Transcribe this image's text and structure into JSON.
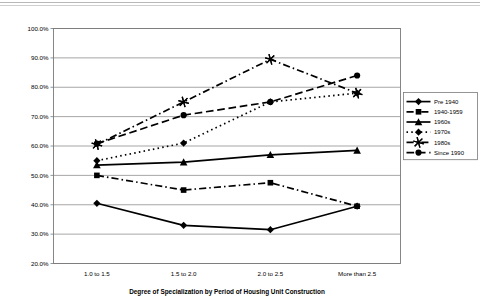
{
  "page": {
    "background_color": "#ffffff",
    "header_rule_color": "#b8b8b8"
  },
  "chart_data": {
    "type": "line",
    "title": "",
    "xlabel": "Degree of Specialization by Period of Housing Unit Construction",
    "ylabel": "",
    "categories": [
      "1.0 to 1.5",
      "1.5 to 2.0",
      "2.0 to 2.5",
      "More than 2.5"
    ],
    "ylim": [
      20,
      100
    ],
    "ytick_values": [
      20,
      30,
      40,
      50,
      60,
      70,
      80,
      90,
      100
    ],
    "ytick_labels": [
      "20.0%",
      "30.0%",
      "40.0%",
      "50.0%",
      "60.0%",
      "70.0%",
      "80.0%",
      "90.0%",
      "100.0%"
    ],
    "grid": "horizontal",
    "legend_position": "right",
    "series": [
      {
        "name": "Pre 1940",
        "marker": "diamond",
        "line_style": "solid",
        "color": "#000000",
        "values": [
          40.5,
          33.0,
          31.5,
          39.5
        ]
      },
      {
        "name": "1940-1959",
        "marker": "square",
        "line_style": "dashdot",
        "color": "#000000",
        "values": [
          50.0,
          45.0,
          47.5,
          39.5
        ]
      },
      {
        "name": "1960s",
        "marker": "triangle",
        "line_style": "solid",
        "color": "#000000",
        "values": [
          53.5,
          54.5,
          57.0,
          58.5
        ]
      },
      {
        "name": "1970s",
        "marker": "diamond",
        "line_style": "dotted",
        "color": "#000000",
        "values": [
          55.0,
          61.0,
          75.0,
          78.0
        ]
      },
      {
        "name": "1980s",
        "marker": "star",
        "line_style": "dashdot",
        "color": "#000000",
        "values": [
          60.5,
          75.0,
          89.5,
          78.0
        ]
      },
      {
        "name": "Since 1990",
        "marker": "circle",
        "line_style": "dashed",
        "color": "#000000",
        "values": [
          60.8,
          70.5,
          75.0,
          84.0
        ]
      }
    ]
  }
}
